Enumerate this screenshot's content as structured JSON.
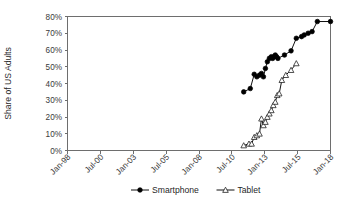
{
  "chart_data": {
    "type": "line",
    "title": "",
    "xlabel": "",
    "ylabel": "Share of US Adults",
    "ylim": [
      0,
      80
    ],
    "ytick_labels": [
      "0%",
      "10%",
      "20%",
      "30%",
      "40%",
      "50%",
      "60%",
      "70%",
      "80%"
    ],
    "ytick_values": [
      0,
      10,
      20,
      30,
      40,
      50,
      60,
      70,
      80
    ],
    "xtick_labels": [
      "Jan-98",
      "Jul-00",
      "Jan-03",
      "Jul-05",
      "Jan-08",
      "Jul-10",
      "Jan-13",
      "Jul-15",
      "Jan-18"
    ],
    "xtick_values": [
      1998.0,
      2000.5,
      2003.0,
      2005.5,
      2008.0,
      2010.5,
      2013.0,
      2015.5,
      2018.0
    ],
    "xlim": [
      1998.0,
      2018.0
    ],
    "grid": "horizontal-dotted-top-only",
    "legend_position": "bottom-center",
    "series": [
      {
        "name": "Smartphone",
        "marker": "filled-circle",
        "color": "#000000",
        "x": [
          2011.4,
          2011.9,
          2012.2,
          2012.4,
          2012.6,
          2012.75,
          2012.9,
          2013.05,
          2013.2,
          2013.35,
          2013.5,
          2013.6,
          2013.7,
          2013.8,
          2013.9,
          2014.0,
          2014.5,
          2015.0,
          2015.4,
          2015.8,
          2016.0,
          2016.3,
          2016.6,
          2017.0,
          2018.0
        ],
        "values": [
          35,
          37,
          45.5,
          44,
          45,
          46,
          44,
          49,
          53,
          55,
          56,
          55,
          56,
          57,
          56,
          55,
          57,
          59.5,
          67,
          68,
          69,
          70,
          71,
          77,
          77
        ]
      },
      {
        "name": "Tablet",
        "marker": "open-triangle",
        "color": "#222222",
        "x": [
          2011.4,
          2011.8,
          2012.0,
          2012.2,
          2012.4,
          2012.6,
          2012.75,
          2012.9,
          2013.05,
          2013.2,
          2013.35,
          2013.5,
          2013.65,
          2013.8,
          2013.95,
          2014.1,
          2014.3,
          2014.6,
          2015.0,
          2015.4
        ],
        "values": [
          3,
          4,
          4,
          8,
          9,
          10,
          19,
          15,
          17,
          20,
          22,
          24,
          27,
          29,
          33,
          34,
          42,
          45,
          48,
          52
        ]
      }
    ]
  },
  "legend": {
    "entries": [
      {
        "label": "Smartphone",
        "marker": "filled-circle"
      },
      {
        "label": "Tablet",
        "marker": "open-triangle"
      }
    ]
  },
  "axis": {
    "y_title": "Share of US Adults"
  }
}
